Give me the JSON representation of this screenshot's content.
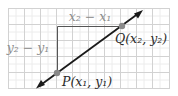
{
  "diagram": {
    "colors": {
      "grid_major": "#c8c8c8",
      "grid_minor": "#e6e6e6",
      "background": "#ffffff",
      "line": "#1a1a1a",
      "legs": "#555555",
      "point": "#8a8a8a",
      "label_muted": "#8c8c8c",
      "label_dark": "#2a2a2a"
    },
    "labels": {
      "run": "x₂ − x₁",
      "rise": "y₂ − y₁",
      "point_p": "P(x₁, y₁)",
      "point_q": "Q(x₂, y₂)"
    },
    "points": {
      "P": {
        "name": "P",
        "x": 57,
        "y": 73
      },
      "Q": {
        "name": "Q",
        "x": 122,
        "y": 26
      }
    }
  }
}
